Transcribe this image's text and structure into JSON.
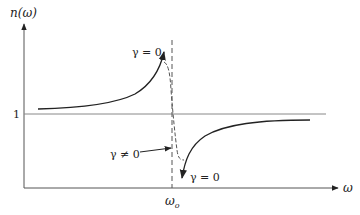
{
  "diagram": {
    "y_axis_label": "n(ω)",
    "x_axis_label": "ω",
    "reference_level_label": "1",
    "resonance_label": "ω",
    "resonance_subscript": "o",
    "annotations": {
      "gamma_zero_upper": "γ = 0",
      "gamma_zero_lower": "γ = 0",
      "gamma_nonzero": "γ ≠ 0"
    },
    "colors": {
      "axis": "#555555",
      "curve": "#222222",
      "reference_line": "#888888",
      "dashed": "#555555"
    }
  }
}
